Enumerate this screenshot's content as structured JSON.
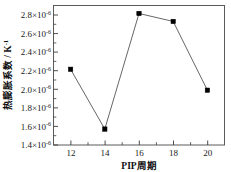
{
  "chart_data": {
    "type": "line",
    "title": "",
    "xlabel": "PIP周期",
    "ylabel": "热膨胀系数 / K⁻¹",
    "ylabel_main": "热膨胀系数 / K",
    "ylabel_exp": "-1",
    "x": [
      12,
      14,
      16,
      18,
      20
    ],
    "values": [
      2.16e-06,
      1.56e-06,
      2.72e-06,
      2.64e-06,
      1.95e-06
    ],
    "xlim": [
      11,
      21
    ],
    "ylim": [
      1.4e-06,
      2.8e-06
    ],
    "xticks": [
      12,
      14,
      16,
      18,
      20
    ],
    "xtick_labels": [
      "12",
      "14",
      "16",
      "18",
      "20"
    ],
    "yticks": [
      1.4e-06,
      1.6e-06,
      1.8e-06,
      2e-06,
      2.2e-06,
      2.4e-06,
      2.6e-06,
      2.8e-06
    ],
    "ytick_labels": [
      {
        "mantissa": "1.4×10",
        "exp": "-6"
      },
      {
        "mantissa": "1.6×10",
        "exp": "-6"
      },
      {
        "mantissa": "1.8×10",
        "exp": "-6"
      },
      {
        "mantissa": "2.0×10",
        "exp": "-6"
      },
      {
        "mantissa": "2.2×10",
        "exp": "-6"
      },
      {
        "mantissa": "2.4×10",
        "exp": "-6"
      },
      {
        "mantissa": "2.6×10",
        "exp": "-6"
      },
      {
        "mantissa": "2.8×10",
        "exp": "-6"
      }
    ],
    "grid": false,
    "legend": null,
    "marker": "square",
    "marker_color": "#000000",
    "line_color": "#555555",
    "frame_color": "#5a5a5a",
    "background": "#ffffff"
  }
}
